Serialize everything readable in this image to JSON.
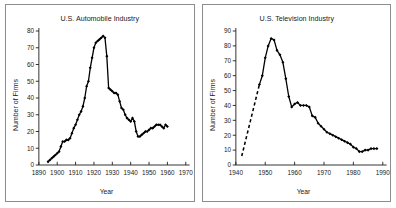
{
  "figure": {
    "background": "#ffffff",
    "border_color": "#8d8d8d",
    "series_color": "#000000"
  },
  "chart_data": [
    {
      "type": "line",
      "title": "U.S. Automobile Industry",
      "xlabel": "Year",
      "ylabel": "Number of Firms",
      "xlim": [
        1890,
        1970
      ],
      "ylim": [
        0,
        80
      ],
      "xticks": [
        1890,
        1900,
        1910,
        1920,
        1930,
        1940,
        1950,
        1960,
        1970
      ],
      "yticks": [
        0,
        10,
        20,
        30,
        40,
        50,
        60,
        70,
        80
      ],
      "grid": false,
      "legend": "none",
      "markers": "filled-diamond",
      "x": [
        1895,
        1896,
        1897,
        1898,
        1899,
        1900,
        1901,
        1902,
        1903,
        1904,
        1905,
        1906,
        1907,
        1908,
        1909,
        1910,
        1911,
        1912,
        1913,
        1914,
        1915,
        1916,
        1917,
        1918,
        1919,
        1920,
        1921,
        1922,
        1923,
        1924,
        1925,
        1926,
        1927,
        1928,
        1929,
        1930,
        1931,
        1932,
        1933,
        1934,
        1935,
        1936,
        1937,
        1938,
        1939,
        1940,
        1941,
        1942,
        1943,
        1944,
        1945,
        1946,
        1947,
        1948,
        1949,
        1950,
        1951,
        1952,
        1953,
        1954,
        1955,
        1956,
        1957,
        1958,
        1959,
        1960
      ],
      "values": [
        2,
        3,
        4,
        5,
        6,
        7,
        8,
        11,
        14,
        14,
        15,
        15,
        16,
        19,
        22,
        24,
        27,
        30,
        32,
        35,
        40,
        47,
        50,
        58,
        64,
        70,
        73,
        74,
        75,
        76,
        77,
        76,
        65,
        46,
        45,
        44,
        43,
        43,
        42,
        38,
        34,
        33,
        30,
        28,
        27,
        26,
        28,
        26,
        20,
        17,
        17,
        18,
        19,
        20,
        20,
        21,
        22,
        22,
        23,
        24,
        24,
        24,
        23,
        22,
        24,
        23
      ],
      "note": "Values after 1920 follow the plotted decline: sharp drop from the 1920s peak to a plateau near 17-24 through the 1930s-1950s, ending near 15 in 1960"
    },
    {
      "type": "line",
      "title": "U.S. Television Industry",
      "xlabel": "Year",
      "ylabel": "Number of Firms",
      "xlim": [
        1940,
        1990
      ],
      "ylim": [
        0,
        90
      ],
      "xticks": [
        1940,
        1950,
        1960,
        1970,
        1980,
        1990
      ],
      "yticks": [
        0,
        10,
        20,
        30,
        40,
        50,
        60,
        70,
        80,
        90
      ],
      "grid": false,
      "legend": "none",
      "markers": "filled-diamond",
      "dashed_segment_years": [
        1942,
        1948
      ],
      "x": [
        1942,
        1943,
        1944,
        1945,
        1946,
        1947,
        1948,
        1949,
        1950,
        1951,
        1952,
        1953,
        1954,
        1955,
        1956,
        1957,
        1958,
        1959,
        1960,
        1961,
        1962,
        1963,
        1964,
        1965,
        1966,
        1967,
        1968,
        1969,
        1970,
        1971,
        1972,
        1973,
        1974,
        1975,
        1976,
        1977,
        1978,
        1979,
        1980,
        1981,
        1982,
        1983,
        1984,
        1985,
        1986,
        1987,
        1988
      ],
      "values": [
        6,
        14,
        22,
        30,
        38,
        46,
        54,
        60,
        72,
        80,
        85,
        84,
        77,
        74,
        69,
        58,
        46,
        39,
        41,
        42,
        40,
        40,
        40,
        39,
        33,
        32,
        28,
        26,
        24,
        22,
        21,
        20,
        19,
        18,
        17,
        16,
        15,
        14,
        12,
        11,
        9,
        9,
        10,
        10,
        11,
        11,
        11
      ]
    }
  ]
}
